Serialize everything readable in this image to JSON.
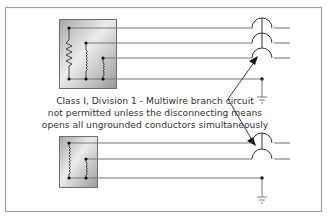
{
  "diagram": {
    "caption_lines": [
      "Class I, Division 1 - Multiwire branch circuit",
      "not permitted unless the disconnecting means",
      "opens all ungrounded conductors simultaneously"
    ],
    "colors": {
      "frame": "#9a9a9a",
      "wire": "#7a7a7a",
      "dark": "#222222",
      "box_light": "#e8e8e8",
      "box_dark": "#9c9c9c",
      "text": "#333333"
    },
    "top_circuit": {
      "loads": [
        "resistor",
        "inductor",
        "inductor-small"
      ],
      "breaker_poles": 3,
      "grounded": true
    },
    "bottom_circuit": {
      "loads": [
        "inductor",
        "inductor-small"
      ],
      "breaker_poles": 2,
      "grounded": true
    }
  }
}
